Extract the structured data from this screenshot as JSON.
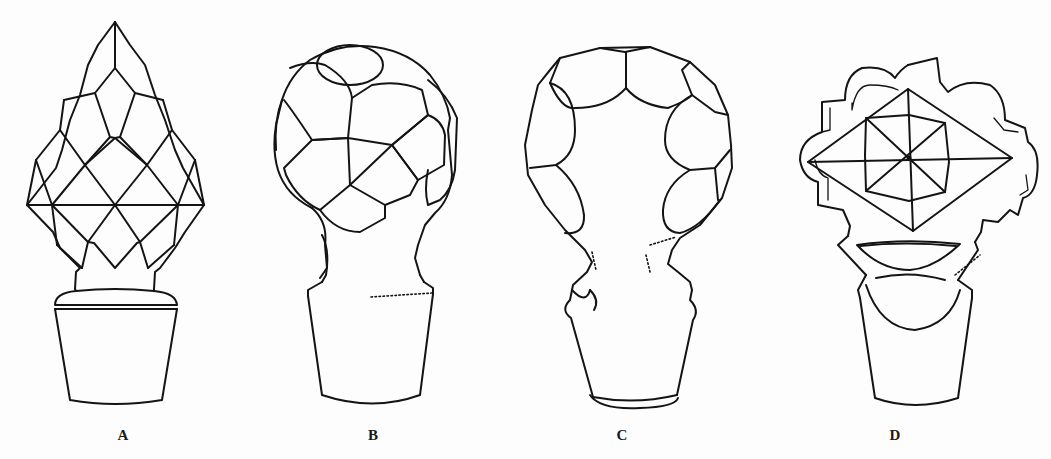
{
  "figure": {
    "stroke_color": "#141414",
    "background_color": "#ffffff",
    "panels": [
      {
        "id": "A",
        "label": "A",
        "shape": "pointed pineapple/diamond-cut stopper",
        "label_x": 123
      },
      {
        "id": "B",
        "label": "B",
        "shape": "ball stopper with hexagonal/printy cuts",
        "label_x": 373
      },
      {
        "id": "C",
        "label": "C",
        "shape": "hollow ball stopper with oval cuts around rim",
        "label_x": 622
      },
      {
        "id": "D",
        "label": "D",
        "shape": "flat scalloped-edge stopper with star-cut diamond",
        "label_x": 895
      }
    ]
  }
}
